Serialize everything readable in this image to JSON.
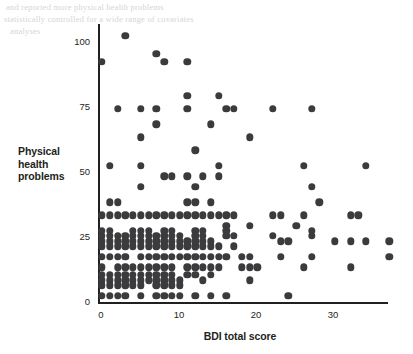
{
  "figure": {
    "background_color": "#ffffff",
    "ink_color": "#231f20",
    "marker_color": "#3b3b3d"
  },
  "labels": {
    "y_axis_title": "Physical\nhealth\nproblems",
    "x_axis_title": "BDI total score"
  },
  "chart_data": {
    "type": "scatter",
    "title": "",
    "xlabel": "BDI total score",
    "ylabel": "Physical health problems",
    "xlim": [
      -1.2,
      38.5
    ],
    "ylim": [
      -2.5,
      105
    ],
    "xticks": [
      0,
      10,
      20,
      30
    ],
    "xtick_labels": [
      "0",
      "10",
      "20",
      "30"
    ],
    "yticks": [
      0,
      25,
      50,
      75,
      100
    ],
    "ytick_labels": [
      "0",
      "25",
      "50",
      "75",
      "100"
    ],
    "grid": false,
    "legend": null,
    "marker": "circle",
    "marker_size": 7.4,
    "points": [
      [
        3,
        102
      ],
      [
        0,
        92
      ],
      [
        7,
        95
      ],
      [
        8,
        92
      ],
      [
        11,
        92
      ],
      [
        11,
        79
      ],
      [
        15,
        79
      ],
      [
        2,
        74
      ],
      [
        5,
        74
      ],
      [
        7,
        74
      ],
      [
        11,
        74
      ],
      [
        16,
        74
      ],
      [
        17,
        74
      ],
      [
        22,
        74
      ],
      [
        27,
        74
      ],
      [
        7,
        68
      ],
      [
        14,
        68
      ],
      [
        5,
        63
      ],
      [
        19,
        63
      ],
      [
        12,
        58
      ],
      [
        1,
        52
      ],
      [
        5,
        52
      ],
      [
        15,
        52
      ],
      [
        26,
        52
      ],
      [
        34,
        52
      ],
      [
        8,
        48
      ],
      [
        9,
        48
      ],
      [
        11,
        48
      ],
      [
        13,
        48
      ],
      [
        15,
        48
      ],
      [
        5,
        44
      ],
      [
        12,
        44
      ],
      [
        27,
        44
      ],
      [
        1,
        38
      ],
      [
        2,
        38
      ],
      [
        11,
        38
      ],
      [
        12,
        38
      ],
      [
        14,
        38
      ],
      [
        28,
        38
      ],
      [
        0,
        33
      ],
      [
        1,
        33
      ],
      [
        2,
        33
      ],
      [
        3,
        33
      ],
      [
        4,
        33
      ],
      [
        5,
        33
      ],
      [
        6,
        33
      ],
      [
        7,
        33
      ],
      [
        8,
        33
      ],
      [
        9,
        33
      ],
      [
        10,
        33
      ],
      [
        11,
        33
      ],
      [
        12,
        33
      ],
      [
        13,
        33
      ],
      [
        14,
        33
      ],
      [
        15,
        33
      ],
      [
        16,
        33
      ],
      [
        17,
        33
      ],
      [
        22,
        33
      ],
      [
        23,
        33
      ],
      [
        26,
        33
      ],
      [
        32,
        33
      ],
      [
        33,
        33
      ],
      [
        16,
        29
      ],
      [
        19,
        29
      ],
      [
        25,
        29
      ],
      [
        0,
        27
      ],
      [
        1,
        27
      ],
      [
        4,
        27
      ],
      [
        5,
        27
      ],
      [
        6,
        27
      ],
      [
        8,
        27
      ],
      [
        9,
        27
      ],
      [
        12,
        27
      ],
      [
        13,
        27
      ],
      [
        16,
        27
      ],
      [
        27,
        27
      ],
      [
        0,
        25
      ],
      [
        1,
        25
      ],
      [
        2,
        25
      ],
      [
        3,
        25
      ],
      [
        4,
        25
      ],
      [
        5,
        25
      ],
      [
        6,
        25
      ],
      [
        7,
        25
      ],
      [
        8,
        25
      ],
      [
        9,
        25
      ],
      [
        10,
        25
      ],
      [
        12,
        25
      ],
      [
        13,
        25
      ],
      [
        16,
        25
      ],
      [
        17,
        25
      ],
      [
        22,
        25
      ],
      [
        27,
        25
      ],
      [
        0,
        23
      ],
      [
        1,
        23
      ],
      [
        2,
        23
      ],
      [
        3,
        23
      ],
      [
        4,
        23
      ],
      [
        5,
        23
      ],
      [
        6,
        23
      ],
      [
        7,
        23
      ],
      [
        8,
        23
      ],
      [
        9,
        23
      ],
      [
        10,
        23
      ],
      [
        11,
        23
      ],
      [
        12,
        23
      ],
      [
        13,
        23
      ],
      [
        14,
        23
      ],
      [
        23,
        23
      ],
      [
        24,
        23
      ],
      [
        30,
        23
      ],
      [
        32,
        23
      ],
      [
        34,
        23
      ],
      [
        37,
        23
      ],
      [
        0,
        21
      ],
      [
        1,
        21
      ],
      [
        2,
        21
      ],
      [
        3,
        21
      ],
      [
        4,
        21
      ],
      [
        5,
        21
      ],
      [
        6,
        21
      ],
      [
        7,
        21
      ],
      [
        8,
        21
      ],
      [
        9,
        21
      ],
      [
        10,
        21
      ],
      [
        11,
        21
      ],
      [
        12,
        21
      ],
      [
        13,
        21
      ],
      [
        14,
        21
      ],
      [
        15,
        21
      ],
      [
        17,
        21
      ],
      [
        0,
        17
      ],
      [
        1,
        17
      ],
      [
        2,
        17
      ],
      [
        3,
        17
      ],
      [
        5,
        17
      ],
      [
        6,
        17
      ],
      [
        7,
        17
      ],
      [
        8,
        17
      ],
      [
        9,
        17
      ],
      [
        10,
        17
      ],
      [
        11,
        17
      ],
      [
        12,
        17
      ],
      [
        13,
        17
      ],
      [
        14,
        17
      ],
      [
        15,
        17
      ],
      [
        16,
        17
      ],
      [
        18,
        17
      ],
      [
        19,
        17
      ],
      [
        23,
        17
      ],
      [
        27,
        17
      ],
      [
        37,
        17
      ],
      [
        0,
        13
      ],
      [
        2,
        13
      ],
      [
        3,
        13
      ],
      [
        4,
        13
      ],
      [
        5,
        13
      ],
      [
        6,
        13
      ],
      [
        7,
        13
      ],
      [
        8,
        13
      ],
      [
        9,
        13
      ],
      [
        11,
        13
      ],
      [
        12,
        13
      ],
      [
        13,
        13
      ],
      [
        14,
        13
      ],
      [
        15,
        13
      ],
      [
        18,
        13
      ],
      [
        19,
        13
      ],
      [
        20,
        13
      ],
      [
        26,
        13
      ],
      [
        32,
        13
      ],
      [
        0,
        10
      ],
      [
        1,
        10
      ],
      [
        2,
        10
      ],
      [
        3,
        10
      ],
      [
        4,
        10
      ],
      [
        5,
        10
      ],
      [
        6,
        10
      ],
      [
        7,
        10
      ],
      [
        8,
        10
      ],
      [
        9,
        10
      ],
      [
        11,
        10
      ],
      [
        12,
        10
      ],
      [
        14,
        10
      ],
      [
        0,
        8
      ],
      [
        1,
        8
      ],
      [
        2,
        8
      ],
      [
        3,
        8
      ],
      [
        4,
        8
      ],
      [
        5,
        8
      ],
      [
        6,
        8
      ],
      [
        7,
        8
      ],
      [
        8,
        8
      ],
      [
        9,
        8
      ],
      [
        10,
        8
      ],
      [
        13,
        8
      ],
      [
        19,
        8
      ],
      [
        0,
        6
      ],
      [
        1,
        6
      ],
      [
        2,
        6
      ],
      [
        3,
        6
      ],
      [
        4,
        6
      ],
      [
        5,
        6
      ],
      [
        7,
        6
      ],
      [
        8,
        6
      ],
      [
        9,
        6
      ],
      [
        10,
        6
      ],
      [
        0,
        2
      ],
      [
        1,
        2
      ],
      [
        2,
        2
      ],
      [
        3,
        2
      ],
      [
        5,
        2
      ],
      [
        7,
        2
      ],
      [
        8,
        2
      ],
      [
        9,
        2
      ],
      [
        10,
        2
      ],
      [
        12,
        2
      ],
      [
        14,
        2
      ],
      [
        16,
        2
      ],
      [
        24,
        2
      ]
    ]
  }
}
